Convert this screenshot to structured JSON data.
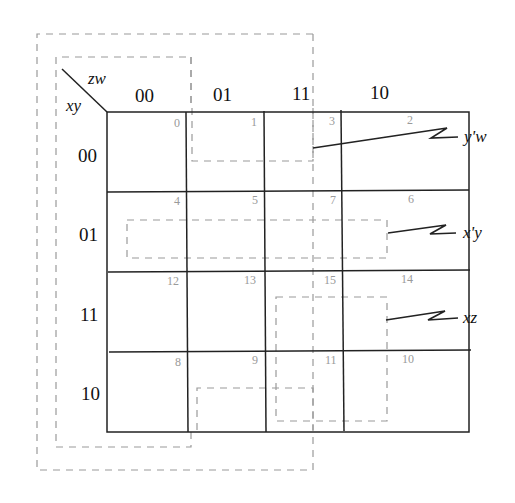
{
  "kmap": {
    "row_variable": "xy",
    "col_variable": "zw",
    "col_headers": [
      "00",
      "01",
      "11",
      "10"
    ],
    "row_headers": [
      "00",
      "01",
      "11",
      "10"
    ],
    "cell_numbers": [
      [
        "0",
        "1",
        "3",
        "2"
      ],
      [
        "4",
        "5",
        "7",
        "6"
      ],
      [
        "12",
        "13",
        "15",
        "14"
      ],
      [
        "8",
        "9",
        "11",
        "10"
      ]
    ],
    "terms": [
      {
        "label": "y'w",
        "cells": [
          1,
          3,
          9,
          11
        ]
      },
      {
        "label": "x'y",
        "cells": [
          4,
          5,
          7,
          6
        ]
      },
      {
        "label": "xz",
        "cells": [
          15,
          14,
          11,
          10
        ]
      }
    ],
    "wrap_groups": [
      {
        "description": "outer wrap group",
        "cells": "left column wrap"
      },
      {
        "description": "inner wrap group",
        "cells": "left column wrap"
      }
    ],
    "colors": {
      "grid": "#222222",
      "dashed_groups": "#9a9a9a",
      "cell_numbers": "#9a9a9a",
      "background": "#ffffff"
    }
  }
}
